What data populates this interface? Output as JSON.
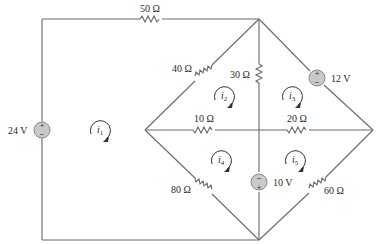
{
  "circuit": {
    "resistors": [
      {
        "id": "R50",
        "label": "50 Ω"
      },
      {
        "id": "R40",
        "label": "40 Ω"
      },
      {
        "id": "R30",
        "label": "30 Ω"
      },
      {
        "id": "R10",
        "label": "10 Ω"
      },
      {
        "id": "R20",
        "label": "20 Ω"
      },
      {
        "id": "R80",
        "label": "80 Ω"
      },
      {
        "id": "R60",
        "label": "60 Ω"
      }
    ],
    "sources": [
      {
        "id": "V24",
        "label": "24 V",
        "plus": "+",
        "minus": "−"
      },
      {
        "id": "V12",
        "label": "12 V",
        "plus": "+",
        "minus": "−"
      },
      {
        "id": "V10",
        "label": "10 V",
        "plus": "+",
        "minus": "−"
      }
    ],
    "mesh_currents": [
      {
        "id": "i1",
        "symbol": "i",
        "sub": "1"
      },
      {
        "id": "i2",
        "symbol": "i",
        "sub": "2"
      },
      {
        "id": "i3",
        "symbol": "i",
        "sub": "3"
      },
      {
        "id": "i4",
        "symbol": "i",
        "sub": "4"
      },
      {
        "id": "i5",
        "symbol": "i",
        "sub": "5"
      }
    ],
    "colors": {
      "wire": "#6a6a6a",
      "source_fill": "#c9c9c9",
      "text": "#2a2a2a"
    }
  }
}
